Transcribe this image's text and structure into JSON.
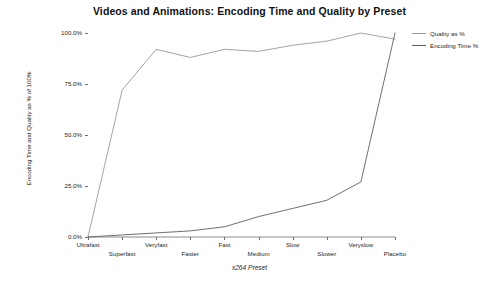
{
  "chart_data": {
    "type": "line",
    "title": "Videos and Animations: Encoding Time and Quality by Preset",
    "xlabel": "x264 Preset",
    "ylabel": "Encoding Time and Quality as % of 100%",
    "categories": [
      "Ultrafast",
      "Superfast",
      "Veryfast",
      "Faster",
      "Fast",
      "Medium",
      "Slow",
      "Slower",
      "Veryslow",
      "Placebo"
    ],
    "series": [
      {
        "name": "Quality as %",
        "color": "#9a9a9a",
        "values": [
          0,
          72,
          92,
          88,
          92,
          91,
          94,
          96,
          100,
          97
        ]
      },
      {
        "name": "Encoding Time %",
        "color": "#5f5f5f",
        "values": [
          0,
          1,
          2,
          3,
          5,
          10,
          14,
          18,
          27,
          100
        ]
      }
    ],
    "ylim": [
      0,
      100
    ],
    "yticks": [
      0,
      25,
      50,
      75,
      100
    ],
    "ytick_labels": [
      "0.0%",
      "25.0%",
      "50.0%",
      "75.0%",
      "100.0%"
    ],
    "grid": false,
    "legend_position": "top-right"
  },
  "legend": {
    "items": [
      {
        "label": "Quality as %"
      },
      {
        "label": "Encoding Time %"
      }
    ]
  },
  "caption": {
    "text": ""
  },
  "colors": {
    "background": "#ffffff",
    "axis": "#6e6e6e",
    "text": "#1f1f1f",
    "series_quality": "#9a9a9a",
    "series_time": "#5f5f5f"
  }
}
